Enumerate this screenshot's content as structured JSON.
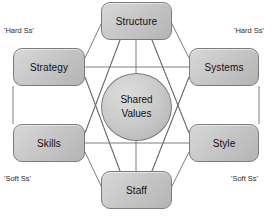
{
  "diagram": {
    "center": {
      "name": "shared-values",
      "line1": "Shared",
      "line2": "Values"
    },
    "nodes": [
      {
        "id": "structure",
        "label": "Structure"
      },
      {
        "id": "strategy",
        "label": "Strategy"
      },
      {
        "id": "systems",
        "label": "Systems"
      },
      {
        "id": "skills",
        "label": "Skills"
      },
      {
        "id": "style",
        "label": "Style"
      },
      {
        "id": "staff",
        "label": "Staff"
      }
    ],
    "corner_labels": {
      "top_left": "'Hard Ss'",
      "top_right": "'Hard Ss'",
      "bottom_left": "'Soft Ss'",
      "bottom_right": "'Soft Ss'"
    },
    "caption": "",
    "colors": {
      "node_fill_light": "#d8d8d8",
      "node_fill_dark": "#b4b4b4",
      "node_border": "#7b7b7b",
      "line": "#6e6e6e",
      "text": "#111111",
      "background": "#ffffff"
    }
  }
}
